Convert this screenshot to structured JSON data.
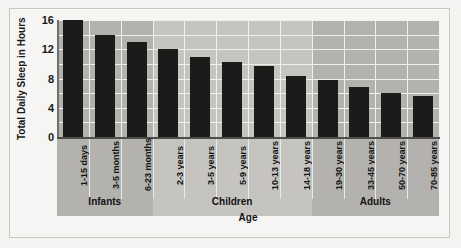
{
  "chart_data": {
    "type": "bar",
    "title": "",
    "xlabel": "Age",
    "ylabel": "Total Daily Sleep in Hours",
    "ylim": [
      0,
      16
    ],
    "yticks": [
      0,
      4,
      8,
      12,
      16
    ],
    "gridlines": [
      2,
      4,
      6,
      8,
      10,
      12,
      14,
      16
    ],
    "grid": true,
    "legend": "none",
    "categories": [
      "1-15 days",
      "3-5 months",
      "6-23 months",
      "2-3 years",
      "3-5 years",
      "5-9 years",
      "10-13 years",
      "14-18 years",
      "19-30 years",
      "33-45 years",
      "50-70 years",
      "70-85 years"
    ],
    "values": [
      16.0,
      14.0,
      13.0,
      12.0,
      11.0,
      10.3,
      9.7,
      8.4,
      7.8,
      6.8,
      6.0,
      5.6
    ],
    "groups": [
      {
        "label": "Infants",
        "start": 0,
        "end": 2,
        "shade": "dark"
      },
      {
        "label": "Children",
        "start": 3,
        "end": 7,
        "shade": "light"
      },
      {
        "label": "Adults",
        "start": 8,
        "end": 11,
        "shade": "dark"
      }
    ],
    "colors": {
      "bar": "#1c1b1a",
      "band_dark": "#b4b2af",
      "band_light": "#c6c4c1",
      "gridline": "#f1f0ee",
      "axis": "#4e4d4b",
      "page_background": "#f4f3f1",
      "text": "#131211"
    }
  }
}
